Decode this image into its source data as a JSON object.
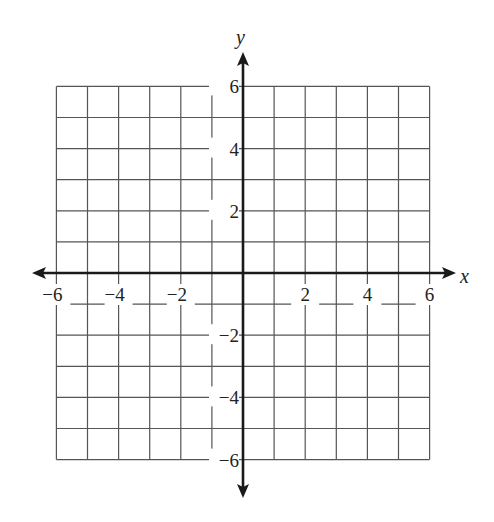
{
  "chart_data": {
    "type": "coordinate-grid",
    "title": "",
    "xlabel": "x",
    "ylabel": "y",
    "xlim": [
      -6,
      6
    ],
    "ylim": [
      -6,
      6
    ],
    "grid": true,
    "grid_step": 1,
    "x_ticks": [
      -6,
      -4,
      -2,
      2,
      4,
      6
    ],
    "y_ticks": [
      6,
      4,
      2,
      -2,
      -4,
      -6
    ],
    "x_tick_labels": [
      "−6",
      "−4",
      "−2",
      "2",
      "4",
      "6"
    ],
    "y_tick_labels": [
      "6",
      "4",
      "2",
      "−2",
      "−4",
      "−6"
    ]
  },
  "colors": {
    "grid": "#555555",
    "axis": "#1a1a1a"
  }
}
